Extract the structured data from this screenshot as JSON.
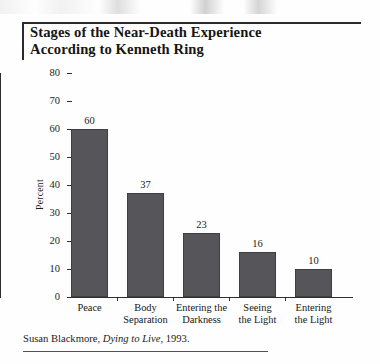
{
  "figure": {
    "title": "Stages of the Near-Death Experience\nAccording to Kenneth Ring",
    "caption_prefix": "Susan Blackmore, ",
    "caption_italic": "Dying to Live",
    "caption_suffix": ", 1993."
  },
  "colors": {
    "bar_fill": "#56565a",
    "bar_stroke": "#3e3e42",
    "axis": "#2f2f2f",
    "rule": "#2b2b2b",
    "text": "#1b1b1b",
    "background": "#fefefe"
  },
  "chart_data": {
    "type": "bar",
    "title": "Stages of the Near-Death Experience According to Kenneth Ring",
    "subtitle": "",
    "xlabel": "",
    "ylabel": "Percent",
    "categories": [
      "Peace",
      "Body Separation",
      "Entering the Darkness",
      "Seeing the Light",
      "Entering the Light"
    ],
    "category_lines": [
      "Peace",
      "Body\nSeparation",
      "Entering the\nDarkness",
      "Seeing\nthe Light",
      "Entering\nthe Light"
    ],
    "values": [
      60,
      37,
      23,
      16,
      10
    ],
    "value_labels": [
      "60",
      "37",
      "23",
      "16",
      "10"
    ],
    "ylim": [
      0,
      80
    ],
    "yticks": [
      0,
      10,
      20,
      30,
      40,
      50,
      60,
      70,
      80
    ],
    "ytick_labels": [
      "0",
      "10",
      "20",
      "30",
      "40",
      "50",
      "60",
      "70",
      "80"
    ],
    "grid": false,
    "legend": "none",
    "source": "Susan Blackmore, Dying to Live, 1993."
  }
}
